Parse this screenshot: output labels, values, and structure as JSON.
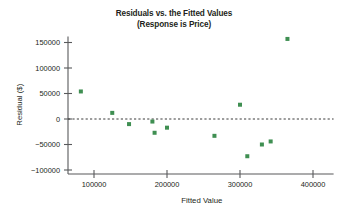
{
  "chart_data": {
    "type": "scatter",
    "title": "Residuals vs. the Fitted Values",
    "subtitle": "(Response is Price)",
    "xlabel": "Fitted Value",
    "ylabel": "Residual ($)",
    "xlim": [
      60000,
      420000
    ],
    "ylim": [
      -112000,
      168000
    ],
    "xticks": [
      100000,
      200000,
      300000,
      400000
    ],
    "xtick_labels": [
      "100000",
      "200000",
      "300000",
      "400000"
    ],
    "yticks": [
      150000,
      100000,
      50000,
      0,
      -50000,
      -100000
    ],
    "ytick_labels": [
      "150000",
      "100000",
      "50000",
      "0",
      "−50000",
      "−100000"
    ],
    "grid": false,
    "legend": "none",
    "reference_line": {
      "y": 0,
      "style": "dashed"
    },
    "marker": {
      "shape": "square",
      "color": "#3f8f52",
      "size": 4
    },
    "points": [
      {
        "x": 82000,
        "y": 54000
      },
      {
        "x": 125000,
        "y": 12000
      },
      {
        "x": 148000,
        "y": -10000
      },
      {
        "x": 180000,
        "y": -5000
      },
      {
        "x": 183000,
        "y": -27000
      },
      {
        "x": 200000,
        "y": -17000
      },
      {
        "x": 265000,
        "y": -33000
      },
      {
        "x": 300000,
        "y": 28000
      },
      {
        "x": 310000,
        "y": -73000
      },
      {
        "x": 330000,
        "y": -50000
      },
      {
        "x": 342000,
        "y": -44000
      },
      {
        "x": 365000,
        "y": 157000
      }
    ]
  }
}
